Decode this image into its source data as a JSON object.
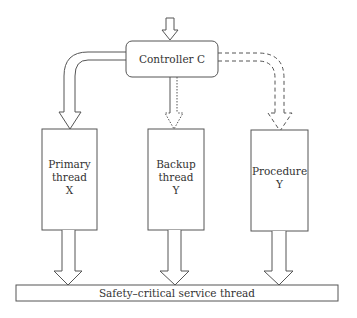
{
  "diagram": {
    "controller": {
      "label": "Controller C"
    },
    "threads": [
      {
        "id": "primary",
        "lines": [
          "Primary",
          "thread",
          "X"
        ],
        "connector": "solid"
      },
      {
        "id": "backup",
        "lines": [
          "Backup",
          "thread",
          "Y"
        ],
        "connector": "dotted"
      },
      {
        "id": "procedure",
        "lines": [
          "Procedure",
          "Y"
        ],
        "connector": "dashed"
      }
    ],
    "service": {
      "label": "Safety–critical service thread"
    },
    "colors": {
      "stroke": "#555555",
      "text": "#333333",
      "background": "#ffffff"
    }
  }
}
